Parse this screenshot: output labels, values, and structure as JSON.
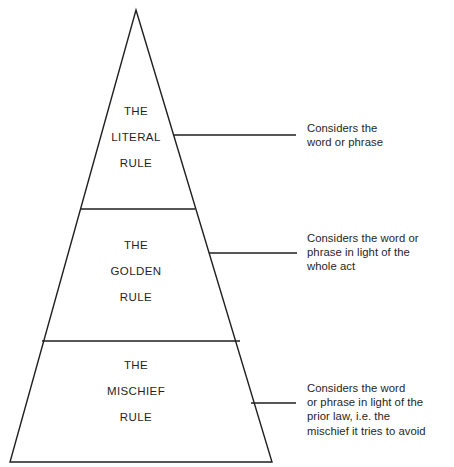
{
  "diagram": {
    "type": "pyramid",
    "stroke_color": "#1f1f1f",
    "background_color": "#ffffff",
    "tiers": [
      {
        "id": "literal",
        "label_lines": [
          "THE",
          "LITERAL",
          "RULE"
        ],
        "annotation_lines": [
          "Considers the",
          "word or phrase"
        ]
      },
      {
        "id": "golden",
        "label_lines": [
          "THE",
          "GOLDEN",
          "RULE"
        ],
        "annotation_lines": [
          "Considers the word or",
          "phrase in light of the",
          "whole act"
        ]
      },
      {
        "id": "mischief",
        "label_lines": [
          "THE",
          "MISCHIEF",
          "RULE"
        ],
        "annotation_lines": [
          "Considers the word",
          "or phrase in light of the",
          "prior law, i.e. the",
          "mischief it tries to avoid"
        ]
      }
    ]
  }
}
